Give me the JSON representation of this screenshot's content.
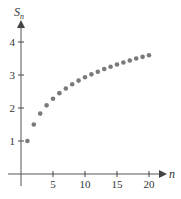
{
  "chart_data": {
    "type": "scatter",
    "title": "",
    "xlabel": "n",
    "ylabel": "S_n",
    "ylabel_main": "S",
    "ylabel_sub": "n",
    "x_ticks": [
      5,
      10,
      15,
      20
    ],
    "y_ticks": [
      1,
      2,
      3,
      4
    ],
    "xlim": [
      0,
      22
    ],
    "ylim": [
      0,
      4.5
    ],
    "grid": false,
    "legend": "none",
    "series": [
      {
        "name": "S_n",
        "x": [
          1,
          2,
          3,
          4,
          5,
          6,
          7,
          8,
          9,
          10,
          11,
          12,
          13,
          14,
          15,
          16,
          17,
          18,
          19,
          20
        ],
        "values": [
          1.0,
          1.5,
          1.83,
          2.08,
          2.28,
          2.45,
          2.59,
          2.72,
          2.83,
          2.93,
          3.02,
          3.1,
          3.18,
          3.25,
          3.32,
          3.38,
          3.44,
          3.5,
          3.55,
          3.6
        ]
      }
    ],
    "colors": {
      "axis": "#444444",
      "points": "#7a7a7a",
      "text": "#333333"
    }
  }
}
